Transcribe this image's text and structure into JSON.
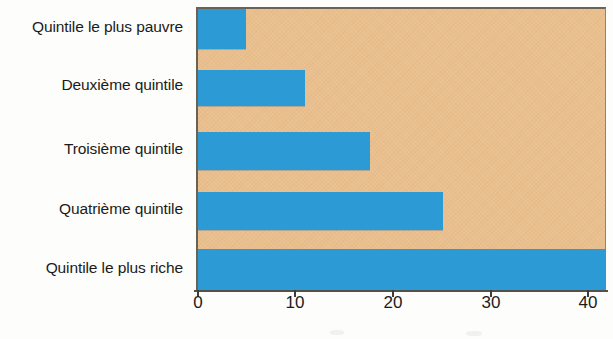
{
  "chart_data": {
    "type": "bar",
    "orientation": "horizontal",
    "title": "",
    "subtitle": "",
    "xlabel": "",
    "ylabel": "",
    "categories": [
      "Quintile le plus pauvre",
      "Deuxième quintile",
      "Troisième quintile",
      "Quatrième quintile",
      "Quintile le plus riche"
    ],
    "values": [
      4.9,
      11.0,
      17.6,
      25.1,
      41.8
    ],
    "series": [
      {
        "name": "Part (%)",
        "values": [
          4.9,
          11.0,
          17.6,
          25.1,
          41.8
        ]
      }
    ],
    "xlim": [
      0,
      42
    ],
    "ylim": null,
    "xticks": [
      0,
      10,
      20,
      30,
      40
    ],
    "xtick_labels": [
      "0",
      "10",
      "20",
      "30",
      "40"
    ],
    "grid": false,
    "legend": false,
    "legend_position": "none",
    "annotations": [],
    "colors": {
      "bar": "#2c9bd5",
      "plot_background": "#e9bf8e",
      "page_background": "#fdfdfb",
      "axis": "#55514a",
      "text": "#1b1b1b"
    }
  }
}
